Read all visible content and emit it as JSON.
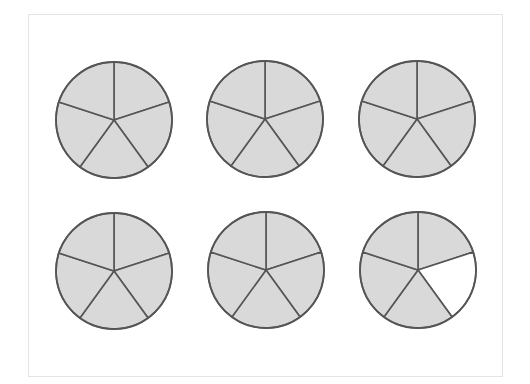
{
  "diagram": {
    "type": "fraction-circles",
    "parts_per_circle": 5,
    "circle_count": 6,
    "radius": 58,
    "colors": {
      "shaded": "#d9d9d9",
      "unshaded": "#ffffff",
      "stroke": "#555555",
      "frame": "#e4e4e4"
    },
    "circles": [
      {
        "id": 1,
        "cx": 114,
        "cy": 120,
        "shaded": [
          true,
          true,
          true,
          true,
          true
        ]
      },
      {
        "id": 2,
        "cx": 265,
        "cy": 119,
        "shaded": [
          true,
          true,
          true,
          true,
          true
        ]
      },
      {
        "id": 3,
        "cx": 417,
        "cy": 119,
        "shaded": [
          true,
          true,
          true,
          true,
          true
        ]
      },
      {
        "id": 4,
        "cx": 114,
        "cy": 271,
        "shaded": [
          true,
          true,
          true,
          true,
          true
        ]
      },
      {
        "id": 5,
        "cx": 266,
        "cy": 270,
        "shaded": [
          true,
          true,
          true,
          true,
          true
        ]
      },
      {
        "id": 6,
        "cx": 418,
        "cy": 270,
        "shaded": [
          true,
          false,
          true,
          true,
          true
        ]
      }
    ],
    "shaded_total": 29,
    "parts_total": 30
  }
}
